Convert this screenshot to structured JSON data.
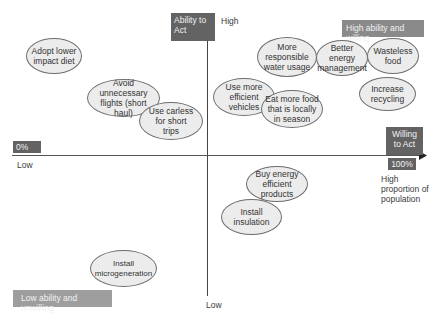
{
  "diagram": {
    "y_axis": {
      "label": "Ability to Act",
      "high_label": "High",
      "low_label": "Low"
    },
    "x_axis": {
      "label": "Willing to Act",
      "low_label": "Low",
      "min_badge": "0%",
      "max_badge": "100%",
      "high_label": "High proportion of population"
    },
    "quadrant_labels": {
      "top_right": "High ability and willing",
      "bottom_left": "Low ability and unwilling"
    },
    "actions": [
      {
        "label": "Adopt lower impact diet"
      },
      {
        "label": "Avoid unnecessary flights (short haul)"
      },
      {
        "label": "Use carless for short trips"
      },
      {
        "label": "Use more efficient vehicles"
      },
      {
        "label": "Eat more food that is locally in season"
      },
      {
        "label": "More responsible water usage"
      },
      {
        "label": "Better energy management"
      },
      {
        "label": "Wasteless food"
      },
      {
        "label": "Increase recycling"
      },
      {
        "label": "Buy energy efficient products"
      },
      {
        "label": "Install insulation"
      },
      {
        "label": "Install microgeneration"
      }
    ],
    "colors": {
      "axis_box": "#636363",
      "quadrant_box": "#8a8a8a",
      "ellipse_fill": "#ececec",
      "ellipse_border": "#6e6e6e"
    }
  }
}
